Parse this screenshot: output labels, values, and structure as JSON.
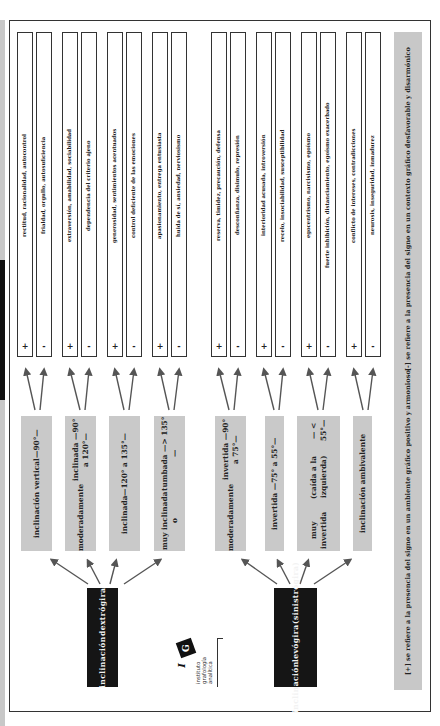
{
  "diagram": {
    "roots": [
      {
        "id": "dextrogira",
        "label_line1": "inclinación",
        "label_line2": "dextrógira",
        "label_line3": "",
        "categories": [
          {
            "label_line1": "inclinación vertical",
            "label_line2": "—90°—",
            "label_line3": "",
            "positive": "rectitud, racionalidad, autocontrol",
            "negative": "frialdad, orgullo, autosuficiencia"
          },
          {
            "label_line1": "moderadamente",
            "label_line2": "inclinada —90° a 120°—",
            "label_line3": "",
            "positive": "extraversión, amabilidad, sociabilidad",
            "negative": "dependencia del criterio ajeno"
          },
          {
            "label_line1": "inclinada",
            "label_line2": "—120° a 135°—",
            "label_line3": "",
            "positive": "generosidad, sentimientos acentuados",
            "negative": "control deficiente de las emociones"
          },
          {
            "label_line1": "muy inclinada o",
            "label_line2": "tumbada —> 135°—",
            "label_line3": "",
            "positive": "apasionamiento, entrega entusiasta",
            "negative": "huida de sí, ansiedad, nerviosismo"
          }
        ]
      },
      {
        "id": "levogira",
        "label_line1": "inclinación",
        "label_line2": "levógira",
        "label_line3": "(sinistrógira)",
        "categories": [
          {
            "label_line1": "moderadamente",
            "label_line2": "invertida —90° a 75°—",
            "label_line3": "",
            "positive": "reserva, timidez, precaución, defensa",
            "negative": "desconfianza, disimulo, represión"
          },
          {
            "label_line1": "invertida —75° a 55°—",
            "label_line2": "",
            "label_line3": "",
            "positive": "interioridad acusada, introversión",
            "negative": "recelo, insociabilidad, susceptibilidad"
          },
          {
            "label_line1": "muy invertida",
            "label_line2": "(caída a la izquierda)",
            "label_line3": "— < 55°—",
            "positive": "egocentrismo, narcisismo, egoísmo",
            "negative": "fuerte inhibición, distanciamiento, egoísmo exacerbado"
          },
          {
            "label_line1": "inclinación ambivalente",
            "label_line2": "",
            "label_line3": "",
            "positive": "conflicto de intereses, contradicciones",
            "negative": "neurosis, inseguridad, inmadurez"
          }
        ]
      }
    ],
    "signs": {
      "positive": "+",
      "negative": "-"
    },
    "legend": {
      "line1": "[+] se refiere a la presencia del signo en un ambiente gráfico positivo y armonioso",
      "line2": "[-] se refiere a la presencia del signo en un contexto gráfico desfavorable y disarmónico"
    },
    "logo": {
      "mark": "G",
      "initial": "I",
      "suffix": "A",
      "line1": "instituto",
      "line2": "grafología",
      "line3": "analítica"
    },
    "colors": {
      "root_bg": "#151515",
      "category_bg": "#c9c9c9",
      "legend_bg": "#c8c8c8",
      "border": "#333333",
      "arrow": "#555555"
    }
  }
}
